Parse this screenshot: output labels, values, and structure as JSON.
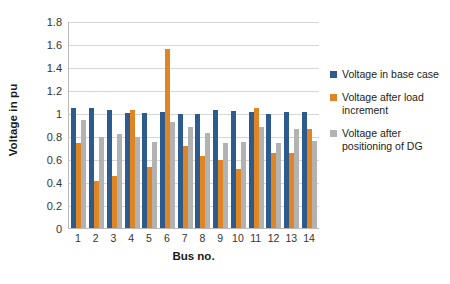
{
  "chart_data": {
    "type": "bar",
    "title": "",
    "xlabel": "Bus no.",
    "ylabel": "Voltage in pu",
    "categories": [
      "1",
      "2",
      "3",
      "4",
      "5",
      "6",
      "7",
      "8",
      "9",
      "10",
      "11",
      "12",
      "13",
      "14"
    ],
    "ylim": [
      0,
      1.8
    ],
    "yticks": [
      "0",
      "0.2",
      "0.4",
      "0.6",
      "0.8",
      "1",
      "1.2",
      "1.4",
      "1.6",
      "1.8"
    ],
    "ytick_values": [
      0,
      0.2,
      0.4,
      0.6,
      0.8,
      1.0,
      1.2,
      1.4,
      1.6,
      1.8
    ],
    "grid": true,
    "legend_position": "right",
    "series": [
      {
        "name": "Voltage in base case",
        "color": "#2e5b8e",
        "values": [
          1.04,
          1.045,
          1.03,
          1.0,
          1.0,
          1.005,
          0.99,
          0.99,
          1.03,
          1.015,
          1.01,
          0.99,
          1.005,
          1.005
        ]
      },
      {
        "name": "Voltage after  load increment",
        "color": "#e08524",
        "values": [
          0.74,
          0.405,
          0.45,
          1.03,
          0.53,
          1.555,
          0.715,
          0.625,
          0.59,
          0.51,
          1.04,
          0.65,
          0.65,
          0.865
        ]
      },
      {
        "name": "Voltage after positioning of DG",
        "color": "#b2b2b2",
        "values": [
          0.94,
          0.795,
          0.815,
          0.79,
          0.75,
          0.925,
          0.88,
          0.825,
          0.74,
          0.745,
          0.88,
          0.735,
          0.865,
          0.755
        ]
      }
    ]
  },
  "legend": {
    "items": [
      {
        "label": "Voltage in base case",
        "swatch": "legend-swatch-base-case"
      },
      {
        "label": "Voltage after  load increment",
        "swatch": "legend-swatch-load-increment"
      },
      {
        "label": "Voltage after positioning of DG",
        "swatch": "legend-swatch-dg"
      }
    ]
  }
}
